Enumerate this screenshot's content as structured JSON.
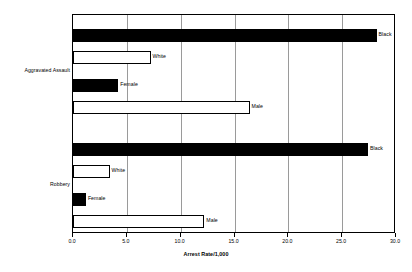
{
  "chart_data": {
    "type": "bar",
    "orientation": "horizontal",
    "title": "",
    "xlabel": "Arrest Rate/1,000",
    "ylabel": "",
    "xlim": [
      0.0,
      30.0
    ],
    "xticks": [
      "0.0",
      "5.0",
      "10.0",
      "15.0",
      "20.0",
      "25.0",
      "30.0"
    ],
    "xtick_values": [
      0.0,
      5.0,
      10.0,
      15.0,
      20.0,
      25.0,
      30.0
    ],
    "grid": true,
    "grid_axis": "x",
    "legend": "none",
    "groups": [
      {
        "name": "Aggravated Assault",
        "bars": [
          {
            "label": "Black",
            "value": 28.2,
            "style": "solid"
          },
          {
            "label": "White",
            "value": 7.2,
            "style": "hollow"
          },
          {
            "label": "Female",
            "value": 4.2,
            "style": "solid"
          },
          {
            "label": "Male",
            "value": 16.4,
            "style": "hollow"
          }
        ]
      },
      {
        "name": "Robbery",
        "bars": [
          {
            "label": "Black",
            "value": 27.4,
            "style": "solid"
          },
          {
            "label": "White",
            "value": 3.4,
            "style": "hollow"
          },
          {
            "label": "Female",
            "value": 1.2,
            "style": "solid"
          },
          {
            "label": "Male",
            "value": 12.2,
            "style": "hollow"
          }
        ]
      }
    ],
    "colors": {
      "solid_fill": "#000000",
      "hollow_fill": "#ffffff",
      "outline": "#000000",
      "gridline": "#9a9a9a",
      "background": "#ffffff"
    }
  }
}
